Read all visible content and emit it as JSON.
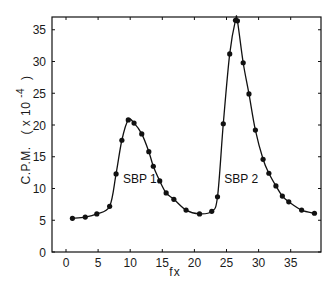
{
  "chart_data": {
    "type": "line",
    "title": "",
    "xlabel": "fx",
    "ylabel": "C.P.M.  ( x 10^-4 )",
    "ylabel_main": "C.P.M.",
    "ylabel_unit_open": "( x 10",
    "ylabel_unit_exp": "-4",
    "ylabel_unit_close": ")",
    "xlim": [
      -2,
      40
    ],
    "ylim": [
      0,
      37
    ],
    "xticks": [
      0,
      5,
      10,
      15,
      20,
      25,
      30,
      35
    ],
    "yticks": [
      0,
      5,
      10,
      15,
      20,
      25,
      30,
      35
    ],
    "xtick_labels": [
      "0",
      "5",
      "10",
      "15",
      "20",
      "25",
      "30",
      "35"
    ],
    "ytick_labels": [
      "0",
      "5",
      "10",
      "15",
      "20",
      "25",
      "30",
      "35"
    ],
    "grid": false,
    "legend": null,
    "frame": "box with inward ticks on all sides",
    "series": [
      {
        "name": "C.P.M.",
        "marker": "filled-circle",
        "line": "smooth",
        "color": "#111111",
        "points": [
          [
            1.0,
            5.3
          ],
          [
            3.0,
            5.5
          ],
          [
            4.8,
            6.0
          ],
          [
            6.8,
            7.2
          ],
          [
            7.8,
            12.3
          ],
          [
            8.7,
            17.6
          ],
          [
            9.7,
            20.8
          ],
          [
            10.6,
            20.3
          ],
          [
            11.8,
            18.6
          ],
          [
            12.9,
            15.8
          ],
          [
            13.6,
            13.5
          ],
          [
            14.6,
            11.2
          ],
          [
            15.6,
            9.3
          ],
          [
            16.8,
            8.3
          ],
          [
            18.7,
            6.6
          ],
          [
            20.8,
            6.0
          ],
          [
            22.7,
            6.4
          ],
          [
            23.6,
            8.7
          ],
          [
            24.5,
            20.2
          ],
          [
            25.5,
            31.2
          ],
          [
            26.4,
            36.5
          ],
          [
            26.7,
            36.4
          ],
          [
            27.6,
            29.8
          ],
          [
            28.5,
            24.9
          ],
          [
            29.5,
            19.2
          ],
          [
            30.7,
            14.6
          ],
          [
            31.6,
            12.4
          ],
          [
            32.7,
            10.4
          ],
          [
            33.7,
            8.8
          ],
          [
            34.7,
            7.9
          ],
          [
            36.7,
            6.6
          ],
          [
            38.7,
            6.1
          ]
        ]
      }
    ],
    "annotations": [
      {
        "text": "SBP 1",
        "x": 11.5,
        "y": 11.5
      },
      {
        "text": "SBP 2",
        "x": 27.3,
        "y": 11.5
      }
    ]
  },
  "colors": {
    "ink": "#111111",
    "background": "#ffffff"
  }
}
